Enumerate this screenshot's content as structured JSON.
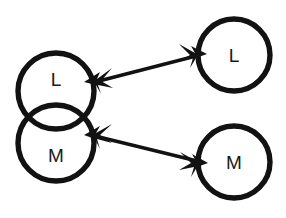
{
  "figure": {
    "kind": "node-link-diagram",
    "background_color": "#ffffff",
    "stroke_color": "#121212",
    "label_color": "#1a1a1a"
  },
  "nodes": [
    {
      "id": "left-l",
      "label": "L",
      "group": "left-overlapping-pair",
      "cx": 56,
      "cy": 91,
      "r": 38,
      "label_x": 56,
      "label_y": 79
    },
    {
      "id": "left-m",
      "label": "M",
      "group": "left-overlapping-pair",
      "cx": 56,
      "cy": 143,
      "r": 38,
      "label_x": 56,
      "label_y": 155
    },
    {
      "id": "right-l",
      "label": "L",
      "group": "right-separate",
      "cx": 234,
      "cy": 55,
      "r": 36,
      "label_x": 234,
      "label_y": 55
    },
    {
      "id": "right-m",
      "label": "M",
      "group": "right-separate",
      "cx": 234,
      "cy": 162,
      "r": 36,
      "label_x": 234,
      "label_y": 162
    }
  ],
  "edges": [
    {
      "id": "edge-l",
      "from": "left-l",
      "to": "right-l",
      "direction": "bidirectional",
      "arrowhead_style": "star",
      "x1": 95,
      "y1": 82,
      "x2": 196,
      "y2": 56
    },
    {
      "id": "edge-m",
      "from": "left-m",
      "to": "right-m",
      "direction": "bidirectional",
      "arrowhead_style": "star",
      "x1": 95,
      "y1": 136,
      "x2": 197,
      "y2": 161
    }
  ]
}
